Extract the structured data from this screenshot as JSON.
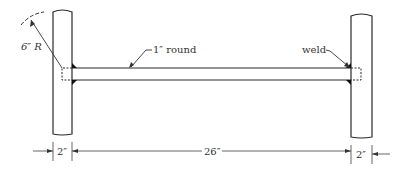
{
  "diagram": {
    "labels": {
      "radius": "6″ R",
      "bar": "1″ round",
      "weld": "weld"
    },
    "dimensions": {
      "left_post_width": "2″",
      "span": "26″",
      "right_post_width": "2″"
    },
    "colors": {
      "line": "#2a2a2a",
      "weld": "#111111",
      "dim": "#555555"
    }
  }
}
